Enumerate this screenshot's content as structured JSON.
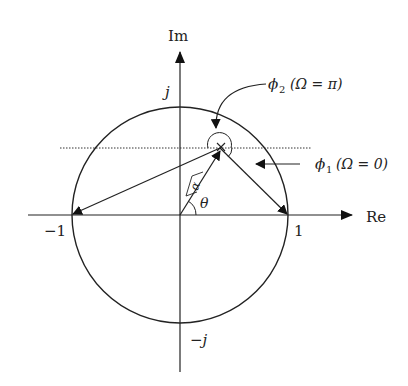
{
  "diagram": {
    "axes": {
      "real_label": "Re",
      "imag_label": "Im"
    },
    "ticks": {
      "j": "j",
      "neg_j": "−j",
      "one": "1",
      "neg_one": "−1"
    },
    "angles": {
      "theta": "θ",
      "alpha": "α"
    },
    "annotations": {
      "phi2": {
        "symbol": "ϕ",
        "sub": "2",
        "condition": "(Ω = π)"
      },
      "phi1": {
        "symbol": "ϕ",
        "sub": "1",
        "condition": "(Ω = 0)"
      }
    },
    "pole_marker": "×",
    "colors": {
      "stroke": "#222222",
      "background": "#ffffff"
    }
  }
}
